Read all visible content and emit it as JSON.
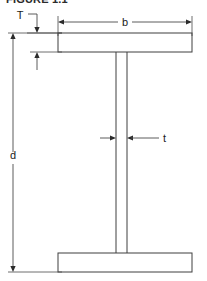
{
  "figure": {
    "title_partial": "FIGURE 1.1",
    "caption": "",
    "type": "engineering-cross-section"
  },
  "colors": {
    "outline": "#3f3f3f",
    "dimension_line": "#4a4a4a",
    "label_text": "#1a1a1a",
    "background": "#ffffff",
    "title_text": "#2b2b2b"
  },
  "dimensions": [
    {
      "symbol": "T",
      "name": "flange-thickness",
      "label_x": 20,
      "label_y": 19,
      "orientation": "vertical",
      "description": "Thickness of the top flange"
    },
    {
      "symbol": "b",
      "name": "flange-width",
      "label_x": 125,
      "label_y": 26,
      "orientation": "horizontal",
      "description": "Overall width of the flange"
    },
    {
      "symbol": "d",
      "name": "overall-depth",
      "label_x": 13,
      "label_y": 159,
      "orientation": "vertical",
      "description": "Overall depth of the section"
    },
    {
      "symbol": "t",
      "name": "web-thickness",
      "label_x": 163,
      "label_y": 142,
      "orientation": "horizontal",
      "description": "Thickness of the vertical web"
    }
  ],
  "geometry": {
    "flange_left_x": 58,
    "flange_right_x": 192,
    "top_flange_top_y": 33,
    "top_flange_bottom_y": 52,
    "bottom_flange_top_y": 253,
    "bottom_flange_bottom_y": 272,
    "web_left_x": 116,
    "web_right_x": 127,
    "depth_dim_line_x": 13,
    "width_dim_line_y": 22
  }
}
